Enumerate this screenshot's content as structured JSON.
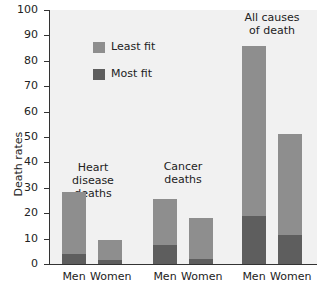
{
  "chart_data": {
    "type": "bar",
    "stacked": true,
    "title": "",
    "xlabel": "",
    "ylabel": "Death rates",
    "ylim": [
      0,
      100
    ],
    "yticks": [
      0,
      10,
      20,
      30,
      40,
      50,
      60,
      70,
      80,
      90,
      100
    ],
    "groups": [
      "Heart disease deaths",
      "Cancer deaths",
      "All causes of death"
    ],
    "categories": [
      "Men",
      "Women",
      "Men",
      "Women",
      "Men",
      "Women"
    ],
    "series": [
      {
        "name": "Most fit",
        "color": "#5e5e5e",
        "values": [
          4,
          1.5,
          7.5,
          2,
          19,
          11.5
        ]
      },
      {
        "name": "Least fit",
        "color": "#8e8e8e",
        "values": [
          28.5,
          9.5,
          25.5,
          18,
          86,
          51
        ]
      }
    ],
    "legend": [
      "Least fit",
      "Most fit"
    ],
    "legend_position": "upper left",
    "grid": false
  },
  "labels": {
    "ylabel": "Death rates",
    "legend_least": "Least fit",
    "legend_most": "Most fit",
    "group1": "Heart disease deaths",
    "group2": "Cancer deaths",
    "group3": "All causes of death",
    "men": "Men",
    "women": "Women"
  }
}
